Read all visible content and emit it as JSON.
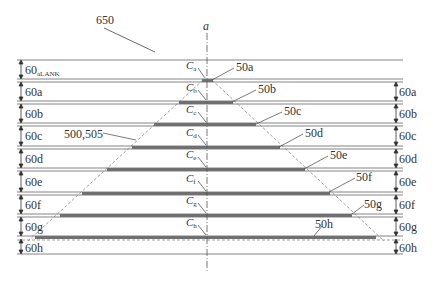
{
  "figure": {
    "reference_label": "650",
    "axis_label": "a",
    "trapezoid_label": "500,505"
  },
  "layers_left": [
    {
      "id": "60aLANK",
      "main": "60",
      "sub": "aLANK"
    },
    {
      "id": "60a",
      "main": "60a"
    },
    {
      "id": "60b",
      "main": "60b"
    },
    {
      "id": "60c",
      "main": "60c"
    },
    {
      "id": "60d",
      "main": "60d"
    },
    {
      "id": "60e",
      "main": "60e"
    },
    {
      "id": "60f",
      "main": "60f"
    },
    {
      "id": "60g",
      "main": "60g"
    },
    {
      "id": "60h",
      "main": "60h"
    }
  ],
  "layers_right": [
    "60a",
    "60b",
    "60c",
    "60d",
    "60e",
    "60f",
    "60g",
    "60h"
  ],
  "bars": [
    {
      "label": "50a",
      "center_label": "C",
      "center_sub": "a"
    },
    {
      "label": "50b",
      "center_label": "C",
      "center_sub": "b"
    },
    {
      "label": "50c",
      "center_label": "C",
      "center_sub": "c"
    },
    {
      "label": "50d",
      "center_label": "C",
      "center_sub": "d"
    },
    {
      "label": "50e",
      "center_label": "C",
      "center_sub": "e"
    },
    {
      "label": "50f",
      "center_label": "C",
      "center_sub": "f"
    },
    {
      "label": "50g",
      "center_label": "C",
      "center_sub": "g"
    },
    {
      "label": "50h",
      "center_label": "C",
      "center_sub": "h"
    }
  ],
  "colors": {
    "line": "#555555",
    "bar": "#707070",
    "text": "#333333"
  }
}
